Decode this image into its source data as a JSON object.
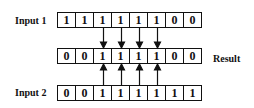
{
  "diagram": {
    "input1": {
      "label": "Input 1",
      "bits": [
        "1",
        "1",
        "1",
        "1",
        "1",
        "1",
        "0",
        "0"
      ]
    },
    "result": {
      "label": "Result",
      "bits": [
        "0",
        "0",
        "1",
        "1",
        "1",
        "1",
        "0",
        "0"
      ]
    },
    "input2": {
      "label": "Input 2",
      "bits": [
        "0",
        "0",
        "1",
        "1",
        "1",
        "1",
        "1",
        "1"
      ]
    },
    "arrow_columns": [
      2,
      3,
      4,
      5
    ]
  }
}
